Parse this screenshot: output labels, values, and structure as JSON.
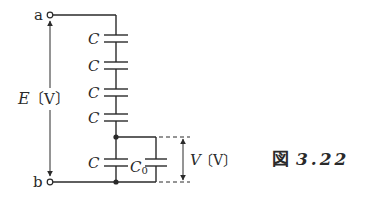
{
  "diagram": {
    "terminals": {
      "top": "a",
      "bottom": "b"
    },
    "source_label": {
      "symbol": "E",
      "unit": "〔V〕"
    },
    "series_capacitors": [
      "C",
      "C",
      "C",
      "C"
    ],
    "lower_capacitor": "C",
    "parallel_capacitor": {
      "symbol": "C",
      "subscript": "0"
    },
    "voltage_label": {
      "symbol": "V",
      "unit": "〔V〕"
    },
    "caption": {
      "prefix": "図",
      "number": "3.22"
    }
  },
  "colors": {
    "line": "#2a2a2a",
    "background": "#ffffff"
  }
}
